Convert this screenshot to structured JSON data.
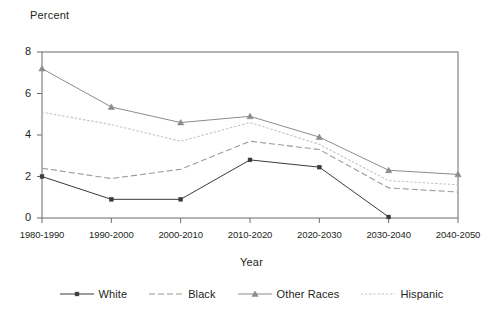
{
  "chart_data": {
    "type": "line",
    "title": "",
    "xlabel": "Year",
    "ylabel": "Percent",
    "categories": [
      "1980-1990",
      "1990-2000",
      "2000-2010",
      "2010-2020",
      "2020-2030",
      "2030-2040",
      "2040-2050"
    ],
    "ylim": [
      0,
      8
    ],
    "yticks": [
      0,
      2,
      4,
      6,
      8
    ],
    "grid": false,
    "legend_position": "bottom",
    "series": [
      {
        "name": "White",
        "color": "#3a3a3a",
        "style": "solid",
        "marker": "square",
        "values": [
          2.0,
          0.9,
          0.9,
          2.8,
          2.45,
          0.05,
          null
        ]
      },
      {
        "name": "Black",
        "color": "#9a9a9a",
        "style": "dashed",
        "marker": "none",
        "values": [
          2.4,
          1.9,
          2.35,
          3.7,
          3.3,
          1.45,
          1.25
        ]
      },
      {
        "name": "Other Races",
        "color": "#8c8c8c",
        "style": "solid",
        "marker": "triangle",
        "values": [
          7.2,
          5.35,
          4.6,
          4.9,
          3.9,
          2.3,
          2.1
        ]
      },
      {
        "name": "Hispanic",
        "color": "#c4c4c4",
        "style": "dotted",
        "marker": "none",
        "values": [
          5.1,
          4.5,
          3.7,
          4.6,
          3.55,
          1.8,
          1.6
        ]
      }
    ]
  },
  "legend": {
    "items": [
      {
        "label": "White"
      },
      {
        "label": "Black"
      },
      {
        "label": "Other Races"
      },
      {
        "label": "Hispanic"
      }
    ]
  },
  "axes": {
    "y_title": "Percent",
    "x_title": "Year",
    "y_tick_labels": [
      "0",
      "2",
      "4",
      "6",
      "8"
    ],
    "x_tick_labels": [
      "1980-1990",
      "1990-2000",
      "2000-2010",
      "2010-2020",
      "2020-2030",
      "2030-2040",
      "2040-2050"
    ]
  },
  "colors": {
    "axis": "#6d6d6d",
    "text": "#231f20"
  }
}
